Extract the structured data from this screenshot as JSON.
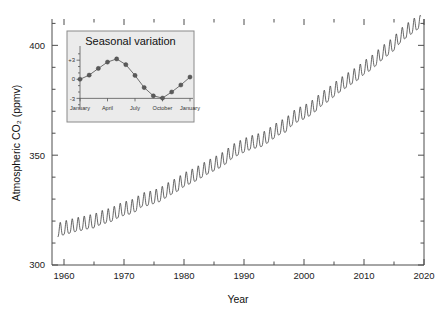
{
  "figure": {
    "background_color": "#ffffff",
    "line_color": "#333333",
    "axis_color": "#4d4d4d"
  },
  "chart_data": {
    "type": "line",
    "title": "",
    "xlabel": "Year",
    "ylabel": "Atmospheric CO₂ (ppmv)",
    "xlim": [
      1958,
      2020
    ],
    "ylim": [
      300,
      412
    ],
    "xticks": [
      1960,
      1970,
      1980,
      1990,
      2000,
      2010,
      2020
    ],
    "xticklabels": [
      "1960",
      "1970",
      "1980",
      "1990",
      "2000",
      "2010",
      "2020"
    ],
    "xminorticks": [
      1965,
      1975,
      1985,
      1995,
      2005,
      2015
    ],
    "yticks": [
      300,
      350,
      400
    ],
    "yticklabels": [
      "300",
      "350",
      "400"
    ],
    "yminorticks": [
      310,
      320,
      330,
      340,
      360,
      370,
      380,
      390,
      410
    ],
    "grid": false,
    "legend": "none",
    "series": [
      {
        "name": "Monthly mean atmospheric CO2 (Keeling curve)",
        "description": "Rising trend with annual sawtooth seasonal oscillation of about 6 ppmv peak-to-peak",
        "annual_mean": [
          {
            "year": 1959,
            "value": 315.9
          },
          {
            "year": 1960,
            "value": 316.9
          },
          {
            "year": 1961,
            "value": 317.6
          },
          {
            "year": 1962,
            "value": 318.4
          },
          {
            "year": 1963,
            "value": 318.9
          },
          {
            "year": 1964,
            "value": 319.6
          },
          {
            "year": 1965,
            "value": 320.0
          },
          {
            "year": 1966,
            "value": 321.4
          },
          {
            "year": 1967,
            "value": 322.2
          },
          {
            "year": 1968,
            "value": 323.0
          },
          {
            "year": 1969,
            "value": 324.6
          },
          {
            "year": 1970,
            "value": 325.7
          },
          {
            "year": 1971,
            "value": 326.3
          },
          {
            "year": 1972,
            "value": 327.5
          },
          {
            "year": 1973,
            "value": 329.7
          },
          {
            "year": 1974,
            "value": 330.2
          },
          {
            "year": 1975,
            "value": 331.1
          },
          {
            "year": 1976,
            "value": 332.0
          },
          {
            "year": 1977,
            "value": 333.8
          },
          {
            "year": 1978,
            "value": 335.4
          },
          {
            "year": 1979,
            "value": 336.8
          },
          {
            "year": 1980,
            "value": 338.8
          },
          {
            "year": 1981,
            "value": 340.1
          },
          {
            "year": 1982,
            "value": 341.4
          },
          {
            "year": 1983,
            "value": 343.0
          },
          {
            "year": 1984,
            "value": 344.6
          },
          {
            "year": 1985,
            "value": 346.0
          },
          {
            "year": 1986,
            "value": 347.4
          },
          {
            "year": 1987,
            "value": 349.2
          },
          {
            "year": 1988,
            "value": 351.6
          },
          {
            "year": 1989,
            "value": 353.1
          },
          {
            "year": 1990,
            "value": 354.4
          },
          {
            "year": 1991,
            "value": 355.6
          },
          {
            "year": 1992,
            "value": 356.4
          },
          {
            "year": 1993,
            "value": 357.1
          },
          {
            "year": 1994,
            "value": 358.8
          },
          {
            "year": 1995,
            "value": 360.8
          },
          {
            "year": 1996,
            "value": 362.6
          },
          {
            "year": 1997,
            "value": 363.7
          },
          {
            "year": 1998,
            "value": 366.7
          },
          {
            "year": 1999,
            "value": 368.4
          },
          {
            "year": 2000,
            "value": 369.6
          },
          {
            "year": 2001,
            "value": 371.1
          },
          {
            "year": 2002,
            "value": 373.2
          },
          {
            "year": 2003,
            "value": 375.8
          },
          {
            "year": 2004,
            "value": 377.5
          },
          {
            "year": 2005,
            "value": 379.8
          },
          {
            "year": 2006,
            "value": 381.9
          },
          {
            "year": 2007,
            "value": 383.8
          },
          {
            "year": 2008,
            "value": 385.6
          },
          {
            "year": 2009,
            "value": 387.4
          },
          {
            "year": 2010,
            "value": 389.9
          },
          {
            "year": 2011,
            "value": 391.6
          },
          {
            "year": 2012,
            "value": 393.9
          },
          {
            "year": 2013,
            "value": 396.5
          },
          {
            "year": 2014,
            "value": 398.6
          },
          {
            "year": 2015,
            "value": 400.8
          },
          {
            "year": 2016,
            "value": 404.2
          },
          {
            "year": 2017,
            "value": 406.5
          },
          {
            "year": 2018,
            "value": 408.5
          },
          {
            "year": 2019,
            "value": 410.5
          }
        ],
        "seasonal_amplitude_ppmv": 3.1,
        "seasonal_peak_month": 5,
        "seasonal_trough_month": 9.5
      }
    ]
  },
  "inset": {
    "title": "Seasonal variation",
    "background_color": "#ebebeb",
    "border_color": "#8a8a8a",
    "ylabel": "",
    "yticklabels": [
      "+3",
      "0",
      "-3"
    ],
    "yticks": [
      3,
      0,
      -3
    ],
    "ylim": [
      -4.2,
      4.6
    ],
    "xticklabels": [
      "January",
      "April",
      "July",
      "October",
      "January"
    ],
    "xtickmonths": [
      1,
      4,
      7,
      10,
      13
    ],
    "type": "line",
    "marker": "circle",
    "points": [
      {
        "month": 1,
        "label": "January",
        "value": 0.0
      },
      {
        "month": 2,
        "label": "February",
        "value": 0.65
      },
      {
        "month": 3,
        "label": "March",
        "value": 1.7
      },
      {
        "month": 4,
        "label": "April",
        "value": 2.7
      },
      {
        "month": 5,
        "label": "May",
        "value": 3.2
      },
      {
        "month": 6,
        "label": "June",
        "value": 2.3
      },
      {
        "month": 7,
        "label": "July",
        "value": 0.6
      },
      {
        "month": 8,
        "label": "August",
        "value": -1.3
      },
      {
        "month": 9,
        "label": "September",
        "value": -2.6
      },
      {
        "month": 10,
        "label": "October",
        "value": -2.95
      },
      {
        "month": 11,
        "label": "November",
        "value": -2.0
      },
      {
        "month": 12,
        "label": "December",
        "value": -0.9
      },
      {
        "month": 13,
        "label": "January",
        "value": 0.35
      }
    ]
  }
}
